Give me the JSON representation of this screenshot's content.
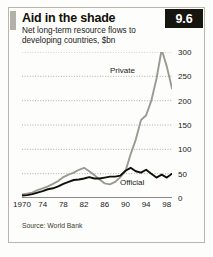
{
  "figure": {
    "title": "Aid in the shade",
    "subtitle": "Net long-term resource flows to developing countries, $bn",
    "badge": "9.6",
    "source": "Source: World Bank"
  },
  "colors": {
    "private_line": "#9a9a92",
    "official_line": "#111008",
    "gridline": "#8d8a82",
    "axis": "#17150f",
    "badge_bg": "#17150f",
    "badge_text": "#ffffff",
    "accent_bar": "#b3b0a8",
    "frame": "#b9b6ae",
    "background": "#fdfdfb"
  },
  "chart_data": {
    "type": "line",
    "title": "Aid in the shade",
    "subtitle": "Net long-term resource flows to developing countries, $bn",
    "xlabel": "",
    "ylabel": "$bn",
    "xlim": [
      1970,
      1999
    ],
    "ylim": [
      0,
      300
    ],
    "yticks": [
      0,
      50,
      100,
      150,
      200,
      250,
      300
    ],
    "ytick_labels": [
      "0",
      "50",
      "100",
      "150",
      "200",
      "250",
      "300"
    ],
    "xticks": [
      1970,
      1974,
      1978,
      1982,
      1986,
      1990,
      1994,
      1998
    ],
    "xtick_labels": [
      "1970",
      "74",
      "78",
      "82",
      "86",
      "90",
      "94",
      "98"
    ],
    "minor_xticks_every": 1,
    "grid": "horizontal-dotted",
    "legend": "inline-annotations",
    "x": [
      1970,
      1971,
      1972,
      1973,
      1974,
      1975,
      1976,
      1977,
      1978,
      1979,
      1980,
      1981,
      1982,
      1983,
      1984,
      1985,
      1986,
      1987,
      1988,
      1989,
      1990,
      1991,
      1992,
      1993,
      1994,
      1995,
      1996,
      1997,
      1998,
      1999
    ],
    "series": [
      {
        "name": "Private",
        "color": "#9a9a92",
        "label_text": "Private",
        "values": [
          7,
          9,
          11,
          16,
          20,
          24,
          29,
          35,
          43,
          48,
          52,
          58,
          62,
          55,
          47,
          38,
          30,
          28,
          33,
          43,
          55,
          90,
          120,
          160,
          170,
          200,
          245,
          305,
          270,
          225
        ]
      },
      {
        "name": "Official",
        "color": "#111008",
        "label_text": "Official",
        "values": [
          5,
          6,
          8,
          11,
          14,
          18,
          20,
          24,
          29,
          33,
          37,
          38,
          40,
          43,
          40,
          40,
          42,
          44,
          44,
          46,
          56,
          62,
          55,
          52,
          58,
          50,
          42,
          48,
          42,
          50
        ]
      }
    ]
  }
}
